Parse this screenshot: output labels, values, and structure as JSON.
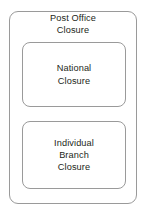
{
  "diagram": {
    "type": "nested-block-diagram",
    "canvas": {
      "width": 146,
      "height": 214,
      "background": "#ffffff"
    },
    "style": {
      "border_color": "#9a9a9a",
      "text_color": "#231f20",
      "fill_color": "#ffffff"
    },
    "outer_block": {
      "title": "Post Office\nClosure",
      "title_line_1": "Post Office",
      "title_line_2": "Closure"
    },
    "inner_blocks": [
      {
        "id": "national-closure",
        "label": "National\nClosure",
        "line_1": "National",
        "line_2": "Closure"
      },
      {
        "id": "individual-branch-closure",
        "label": "Individual\nBranch\nClosure",
        "line_1": "Individual",
        "line_2": "Branch",
        "line_3": "Closure"
      }
    ]
  }
}
